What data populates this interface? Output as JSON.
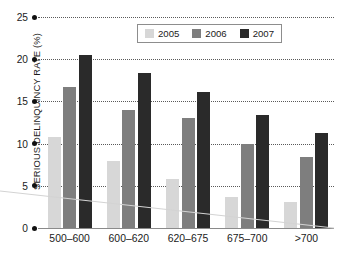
{
  "chart_data": {
    "type": "bar",
    "title": "",
    "xlabel": "",
    "ylabel": "SERIOUS DELINQUINCY RATE (%)",
    "categories": [
      "500–600",
      "600–620",
      "620–675",
      "675–700",
      ">700"
    ],
    "series": [
      {
        "name": "2005",
        "color": "#d7d7d7",
        "values": [
          10.8,
          7.9,
          5.8,
          3.7,
          3.1
        ]
      },
      {
        "name": "2006",
        "color": "#7e7e7e",
        "values": [
          16.7,
          14.0,
          13.0,
          9.9,
          8.4
        ]
      },
      {
        "name": "2007",
        "color": "#2a2a2a",
        "values": [
          20.5,
          18.4,
          16.1,
          13.4,
          11.2
        ]
      }
    ],
    "ylim": [
      0,
      25
    ],
    "ytick_labels": [
      "0",
      "5",
      "10",
      "15",
      "20",
      "25"
    ],
    "ytick_values": [
      0,
      5,
      10,
      15,
      20,
      25
    ],
    "grid": true,
    "legend_position": "top-center"
  },
  "axis": {
    "y_title": "SERIOUS DELINQUINCY RATE (%)"
  },
  "legend": {
    "entries": [
      {
        "label": "2005",
        "color": "#d7d7d7"
      },
      {
        "label": "2006",
        "color": "#7e7e7e"
      },
      {
        "label": "2007",
        "color": "#2a2a2a"
      }
    ]
  },
  "footer": {
    "clipped_text": ""
  }
}
